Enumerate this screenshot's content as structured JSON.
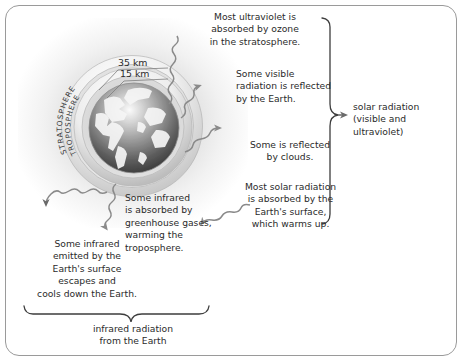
{
  "diagram": {
    "frame": {
      "border_color": "#9a9a9a",
      "background": "#ffffff"
    }
  },
  "globe": {
    "label_outer": "STRATOSPHERE",
    "label_inner": "TROPOSPHERE",
    "altitude_outer": "35 km",
    "altitude_inner": "15 km"
  },
  "callouts": {
    "ultraviolet": "Most ultraviolet is\nabsorbed by ozone\nin the stratosphere.",
    "visible_reflected": "Some visible\nradiation is reflected\nby the Earth.",
    "clouds": "Some is reflected\nby clouds.",
    "absorbed_surface": "Most solar radiation\nis absorbed by the\nEarth's surface,\nwhich warms up.",
    "greenhouse": "Some infrared\nis absorbed by\ngreenhouse gases,\nwarming the\ntroposphere.",
    "escapes": "Some infrared\nemitted by the\nEarth's surface\nescapes and\ncools down the Earth."
  },
  "braces": {
    "right_label": "solar radiation\n(visible and\nultraviolet)",
    "bottom_label": "infrared radiation\nfrom the Earth"
  },
  "colors": {
    "text": "#2b2b2b",
    "line": "#6f6f6f",
    "brace": "#3d3d3d",
    "frame": "#9a9a9a",
    "globe_dark": "#4a4a4a",
    "globe_light": "#f2f2f2"
  }
}
